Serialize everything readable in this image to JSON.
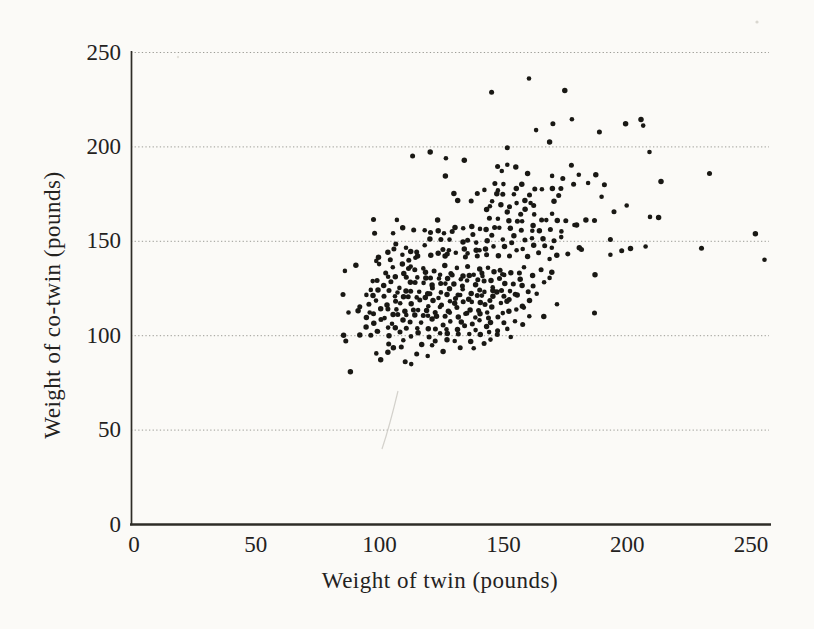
{
  "chart_data": {
    "type": "scatter",
    "title": "",
    "xlabel": "Weight of twin (pounds)",
    "ylabel": "Weight of co-twin (pounds)",
    "xlim": [
      0,
      258
    ],
    "ylim": [
      0,
      250
    ],
    "x_ticks": [
      0,
      50,
      100,
      150,
      200,
      250
    ],
    "y_ticks": [
      0,
      50,
      100,
      150,
      200,
      250
    ],
    "gridlines_y": [
      50,
      100,
      150,
      200,
      250
    ],
    "grid": "horizontal-dotted",
    "legend": "none",
    "colors": {
      "dot": "#191814",
      "grid": "#9c9c96",
      "axis": "#2e2c27",
      "text": "#24221e",
      "background": "#fbfaf7"
    },
    "points": [
      [
        161,
        235
      ],
      [
        175,
        230
      ],
      [
        145,
        228
      ],
      [
        177,
        215
      ],
      [
        206,
        214
      ],
      [
        170,
        213
      ],
      [
        206,
        211
      ],
      [
        200,
        211
      ],
      [
        189,
        208
      ],
      [
        163,
        208
      ],
      [
        168,
        203
      ],
      [
        152,
        199
      ],
      [
        209,
        198
      ],
      [
        120,
        197
      ],
      [
        114,
        194
      ],
      [
        127,
        194
      ],
      [
        134,
        192
      ],
      [
        147,
        190
      ],
      [
        152,
        190
      ],
      [
        155,
        190
      ],
      [
        177,
        190
      ],
      [
        150,
        186
      ],
      [
        160,
        186
      ],
      [
        233,
        185
      ],
      [
        169,
        185
      ],
      [
        127,
        184
      ],
      [
        174,
        184
      ],
      [
        180,
        185
      ],
      [
        188,
        184
      ],
      [
        191,
        180
      ],
      [
        184,
        180
      ],
      [
        213,
        182
      ],
      [
        147,
        180
      ],
      [
        150,
        181
      ],
      [
        157,
        180
      ],
      [
        179,
        179
      ],
      [
        148,
        177
      ],
      [
        155,
        177
      ],
      [
        162,
        178
      ],
      [
        166,
        177
      ],
      [
        130,
        176
      ],
      [
        139,
        175
      ],
      [
        143,
        176
      ],
      [
        170,
        178
      ],
      [
        173,
        177
      ],
      [
        189,
        174
      ],
      [
        132,
        171
      ],
      [
        137,
        172
      ],
      [
        145,
        171
      ],
      [
        148,
        174
      ],
      [
        150,
        175
      ],
      [
        154,
        174
      ],
      [
        158,
        172
      ],
      [
        161,
        174
      ],
      [
        161,
        171
      ],
      [
        170,
        171
      ],
      [
        173,
        173
      ],
      [
        200,
        169
      ],
      [
        143,
        166
      ],
      [
        194,
        166
      ],
      [
        145,
        168
      ],
      [
        149,
        170
      ],
      [
        152,
        168
      ],
      [
        156,
        169
      ],
      [
        159,
        167
      ],
      [
        162,
        168
      ],
      [
        169,
        165
      ],
      [
        152,
        165
      ],
      [
        157,
        165
      ],
      [
        162,
        164
      ],
      [
        184,
        160
      ],
      [
        187,
        161
      ],
      [
        209,
        162
      ],
      [
        212,
        163
      ],
      [
        98,
        161
      ],
      [
        107,
        162
      ],
      [
        123,
        161
      ],
      [
        145,
        161
      ],
      [
        148,
        162
      ],
      [
        152,
        160
      ],
      [
        155,
        161
      ],
      [
        158,
        160
      ],
      [
        162,
        159
      ],
      [
        165,
        161
      ],
      [
        168,
        160
      ],
      [
        172,
        161
      ],
      [
        175,
        160
      ],
      [
        178,
        159
      ],
      [
        180,
        158
      ],
      [
        98,
        155
      ],
      [
        105,
        154
      ],
      [
        110,
        156
      ],
      [
        114,
        156
      ],
      [
        118,
        155
      ],
      [
        123,
        156
      ],
      [
        121,
        154
      ],
      [
        126,
        155
      ],
      [
        130,
        157
      ],
      [
        130,
        154
      ],
      [
        134,
        157
      ],
      [
        137,
        157
      ],
      [
        137,
        154
      ],
      [
        141,
        156
      ],
      [
        143,
        157
      ],
      [
        146,
        157
      ],
      [
        149,
        156
      ],
      [
        153,
        157
      ],
      [
        157,
        155
      ],
      [
        161,
        156
      ],
      [
        165,
        155
      ],
      [
        169,
        157
      ],
      [
        173,
        155
      ],
      [
        121,
        150
      ],
      [
        125,
        151
      ],
      [
        128,
        150
      ],
      [
        133,
        150
      ],
      [
        136,
        150
      ],
      [
        139,
        150
      ],
      [
        143,
        150
      ],
      [
        146,
        152
      ],
      [
        150,
        151
      ],
      [
        154,
        152
      ],
      [
        158,
        151
      ],
      [
        162,
        151
      ],
      [
        166,
        152
      ],
      [
        170,
        150
      ],
      [
        174,
        151
      ],
      [
        252,
        154
      ],
      [
        193,
        150
      ],
      [
        110,
        147
      ],
      [
        113,
        144
      ],
      [
        115,
        145
      ],
      [
        114,
        141
      ],
      [
        116,
        141
      ],
      [
        112,
        140
      ],
      [
        109,
        142
      ],
      [
        123,
        144
      ],
      [
        126,
        145
      ],
      [
        128,
        146
      ],
      [
        126,
        142
      ],
      [
        128,
        142
      ],
      [
        131,
        144
      ],
      [
        134,
        145
      ],
      [
        134,
        142
      ],
      [
        136,
        143
      ],
      [
        139,
        146
      ],
      [
        139,
        142
      ],
      [
        141,
        144
      ],
      [
        143,
        146
      ],
      [
        143,
        142
      ],
      [
        98,
        140
      ],
      [
        100,
        141
      ],
      [
        230,
        147
      ],
      [
        207,
        147
      ],
      [
        202,
        145
      ],
      [
        198,
        145
      ],
      [
        193,
        142
      ],
      [
        180,
        147
      ],
      [
        182,
        145
      ],
      [
        146,
        148
      ],
      [
        150,
        147
      ],
      [
        154,
        148
      ],
      [
        158,
        146
      ],
      [
        162,
        147
      ],
      [
        166,
        148
      ],
      [
        170,
        146
      ],
      [
        148,
        143
      ],
      [
        152,
        142
      ],
      [
        156,
        144
      ],
      [
        160,
        142
      ],
      [
        164,
        143
      ],
      [
        168,
        141
      ],
      [
        172,
        142
      ],
      [
        176,
        144
      ],
      [
        255,
        140
      ],
      [
        104,
        143
      ],
      [
        106,
        146
      ],
      [
        118,
        147
      ],
      [
        120,
        143
      ],
      [
        107,
        148
      ],
      [
        86,
        135
      ],
      [
        90,
        137
      ],
      [
        105,
        139
      ],
      [
        100,
        138
      ],
      [
        109,
        137
      ],
      [
        111,
        136
      ],
      [
        113,
        136
      ],
      [
        187,
        133
      ],
      [
        102,
        133
      ],
      [
        106,
        135
      ],
      [
        110,
        133
      ],
      [
        114,
        134
      ],
      [
        117,
        136
      ],
      [
        119,
        133
      ],
      [
        122,
        135
      ],
      [
        124,
        132
      ],
      [
        127,
        136
      ],
      [
        129,
        133
      ],
      [
        131,
        135
      ],
      [
        133,
        132
      ],
      [
        136,
        136
      ],
      [
        138,
        133
      ],
      [
        140,
        135
      ],
      [
        142,
        132
      ],
      [
        144,
        136
      ],
      [
        146,
        133
      ],
      [
        148,
        135
      ],
      [
        150,
        132
      ],
      [
        153,
        134
      ],
      [
        156,
        133
      ],
      [
        159,
        135
      ],
      [
        162,
        132
      ],
      [
        165,
        134
      ],
      [
        168,
        131
      ],
      [
        170,
        133
      ],
      [
        99,
        130
      ],
      [
        103,
        131
      ],
      [
        107,
        130
      ],
      [
        111,
        131
      ],
      [
        115,
        130
      ],
      [
        118,
        131
      ],
      [
        121,
        130
      ],
      [
        124,
        131
      ],
      [
        127,
        130
      ],
      [
        130,
        131
      ],
      [
        133,
        130
      ],
      [
        136,
        131
      ],
      [
        139,
        130
      ],
      [
        142,
        131
      ],
      [
        145,
        130
      ],
      [
        148,
        130
      ],
      [
        151,
        131
      ],
      [
        157,
        130
      ],
      [
        85,
        121
      ],
      [
        94,
        122
      ],
      [
        158,
        126
      ],
      [
        162,
        127
      ],
      [
        166,
        128
      ],
      [
        148,
        122
      ],
      [
        155,
        122
      ],
      [
        97,
        128
      ],
      [
        101,
        127
      ],
      [
        105,
        128
      ],
      [
        108,
        126
      ],
      [
        112,
        128
      ],
      [
        115,
        127
      ],
      [
        118,
        128
      ],
      [
        121,
        126
      ],
      [
        124,
        128
      ],
      [
        127,
        127
      ],
      [
        130,
        128
      ],
      [
        133,
        126
      ],
      [
        136,
        128
      ],
      [
        139,
        127
      ],
      [
        142,
        128
      ],
      [
        145,
        126
      ],
      [
        151,
        127
      ],
      [
        154,
        128
      ],
      [
        96,
        124
      ],
      [
        100,
        123
      ],
      [
        104,
        124
      ],
      [
        107,
        122
      ],
      [
        110,
        124
      ],
      [
        113,
        123
      ],
      [
        116,
        124
      ],
      [
        119,
        122
      ],
      [
        122,
        124
      ],
      [
        125,
        123
      ],
      [
        128,
        124
      ],
      [
        131,
        122
      ],
      [
        134,
        124
      ],
      [
        137,
        123
      ],
      [
        140,
        124
      ],
      [
        143,
        122
      ],
      [
        146,
        124
      ],
      [
        149,
        123
      ],
      [
        152,
        124
      ],
      [
        156,
        121
      ],
      [
        160,
        124
      ],
      [
        163,
        122
      ],
      [
        98,
        120
      ],
      [
        102,
        121
      ],
      [
        106,
        120
      ],
      [
        109,
        121
      ],
      [
        112,
        120
      ],
      [
        115,
        121
      ],
      [
        118,
        120
      ],
      [
        121,
        121
      ],
      [
        124,
        120
      ],
      [
        127,
        121
      ],
      [
        130,
        120
      ],
      [
        133,
        121
      ],
      [
        136,
        120
      ],
      [
        139,
        121
      ],
      [
        142,
        120
      ],
      [
        146,
        121
      ],
      [
        150,
        120
      ],
      [
        171,
        117
      ],
      [
        161,
        118
      ],
      [
        92,
        116
      ],
      [
        87,
        112
      ],
      [
        92,
        112
      ],
      [
        187,
        112
      ],
      [
        158,
        114
      ],
      [
        157,
        116
      ],
      [
        145,
        118
      ],
      [
        149,
        118
      ],
      [
        151,
        118
      ],
      [
        153,
        118
      ],
      [
        150,
        112
      ],
      [
        152,
        112
      ],
      [
        95,
        117
      ],
      [
        99,
        118
      ],
      [
        103,
        117
      ],
      [
        106,
        118
      ],
      [
        109,
        116
      ],
      [
        113,
        117
      ],
      [
        116,
        118
      ],
      [
        119,
        116
      ],
      [
        122,
        118
      ],
      [
        125,
        117
      ],
      [
        128,
        118
      ],
      [
        131,
        116
      ],
      [
        134,
        118
      ],
      [
        137,
        117
      ],
      [
        140,
        118
      ],
      [
        143,
        116
      ],
      [
        96,
        113
      ],
      [
        100,
        114
      ],
      [
        104,
        113
      ],
      [
        107,
        114
      ],
      [
        110,
        112
      ],
      [
        113,
        114
      ],
      [
        116,
        113
      ],
      [
        119,
        114
      ],
      [
        122,
        112
      ],
      [
        125,
        114
      ],
      [
        128,
        113
      ],
      [
        131,
        114
      ],
      [
        134,
        112
      ],
      [
        137,
        113
      ],
      [
        140,
        114
      ],
      [
        143,
        112
      ],
      [
        146,
        114
      ],
      [
        148,
        110
      ],
      [
        155,
        113
      ],
      [
        94,
        110
      ],
      [
        98,
        111
      ],
      [
        102,
        110
      ],
      [
        105,
        111
      ],
      [
        108,
        110
      ],
      [
        111,
        111
      ],
      [
        114,
        110
      ],
      [
        117,
        111
      ],
      [
        120,
        110
      ],
      [
        123,
        111
      ],
      [
        126,
        110
      ],
      [
        129,
        111
      ],
      [
        132,
        110
      ],
      [
        135,
        111
      ],
      [
        138,
        110
      ],
      [
        141,
        111
      ],
      [
        144,
        110
      ],
      [
        160,
        110
      ],
      [
        167,
        109
      ],
      [
        158,
        106
      ],
      [
        144,
        101
      ],
      [
        97,
        107
      ],
      [
        101,
        108
      ],
      [
        105,
        107
      ],
      [
        109,
        108
      ],
      [
        113,
        106
      ],
      [
        117,
        107
      ],
      [
        121,
        108
      ],
      [
        125,
        106
      ],
      [
        129,
        107
      ],
      [
        133,
        108
      ],
      [
        137,
        106
      ],
      [
        141,
        107
      ],
      [
        145,
        107
      ],
      [
        150,
        106
      ],
      [
        154,
        108
      ],
      [
        95,
        104
      ],
      [
        99,
        103
      ],
      [
        103,
        104
      ],
      [
        107,
        103
      ],
      [
        111,
        104
      ],
      [
        115,
        103
      ],
      [
        119,
        104
      ],
      [
        123,
        103
      ],
      [
        127,
        104
      ],
      [
        131,
        103
      ],
      [
        135,
        104
      ],
      [
        139,
        103
      ],
      [
        143,
        104
      ],
      [
        147,
        103
      ],
      [
        152,
        103
      ],
      [
        92,
        101
      ],
      [
        96,
        100
      ],
      [
        100,
        101
      ],
      [
        104,
        100
      ],
      [
        108,
        101
      ],
      [
        112,
        100
      ],
      [
        116,
        101
      ],
      [
        120,
        100
      ],
      [
        124,
        101
      ],
      [
        128,
        100
      ],
      [
        132,
        101
      ],
      [
        136,
        100
      ],
      [
        140,
        101
      ],
      [
        148,
        100
      ],
      [
        153,
        100
      ],
      [
        85,
        100
      ],
      [
        87,
        96
      ],
      [
        145,
        98
      ],
      [
        127,
        97
      ],
      [
        103,
        96
      ],
      [
        110,
        97
      ],
      [
        117,
        96
      ],
      [
        122,
        97
      ],
      [
        131,
        96
      ],
      [
        137,
        97
      ],
      [
        142,
        95
      ],
      [
        98,
        91
      ],
      [
        106,
        93
      ],
      [
        115,
        91
      ],
      [
        119,
        89
      ],
      [
        104,
        90
      ],
      [
        109,
        94
      ],
      [
        121,
        94
      ],
      [
        125,
        92
      ],
      [
        133,
        93
      ],
      [
        138,
        94
      ],
      [
        100,
        87
      ],
      [
        111,
        85
      ],
      [
        113,
        85
      ],
      [
        88,
        80
      ]
    ]
  }
}
